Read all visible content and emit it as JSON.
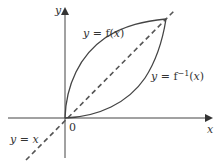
{
  "diagram": {
    "axes": {
      "x_label": "x",
      "y_label": "y",
      "origin_label": "0"
    },
    "curves": [
      {
        "name": "f",
        "label_prefix": "y = ",
        "label_func": "f(x)",
        "style": "solid"
      },
      {
        "name": "f_inverse",
        "label_prefix": "y = ",
        "label_func": "f",
        "label_sup": "−1",
        "label_arg": "(x)",
        "style": "solid"
      },
      {
        "name": "identity",
        "label": "y = x",
        "style": "dashed"
      }
    ],
    "colors": {
      "line": "#444444",
      "background": "#ffffff"
    }
  }
}
